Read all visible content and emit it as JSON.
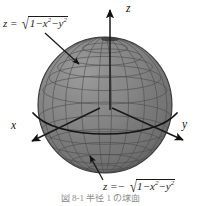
{
  "figure": {
    "type": "geometry-diagram",
    "background_color": "#ffffff",
    "sphere": {
      "fill_color": "#808080",
      "grid_color": "#4a4a4a",
      "outline_color": "#3a3a3a",
      "equator_color": "#1a1a1a",
      "center_x": 105,
      "center_y": 105,
      "radius_x": 67,
      "radius_y": 68,
      "meridian_count": 16,
      "parallel_count": 11
    },
    "axes": [
      {
        "name": "z-axis",
        "label": "z",
        "direction": "up",
        "tip_x": 110,
        "tip_y": 8,
        "tail_x": 110,
        "tail_y": 112
      },
      {
        "name": "x-axis",
        "label": "x",
        "direction": "down-left",
        "tip_x": 30,
        "tip_y": 143,
        "tail_x": 100,
        "tail_y": 108
      },
      {
        "name": "y-axis",
        "label": "y",
        "direction": "down-right",
        "tip_x": 185,
        "tip_y": 142,
        "tail_x": 112,
        "tail_y": 108
      }
    ],
    "labels": {
      "upper_hemisphere": {
        "lhs": "z",
        "equals": "=",
        "sign": "",
        "radical_glyph": "√",
        "radicand_parts": [
          "1",
          "−",
          "x",
          "2",
          "−",
          "y",
          "2"
        ],
        "plain_text": "z = √(1 − x² − y²)"
      },
      "lower_hemisphere": {
        "lhs": "z",
        "equals": "=",
        "sign": "−",
        "radical_glyph": "√",
        "radicand_parts": [
          "1",
          "−",
          "x",
          "2",
          "−",
          "y",
          "2"
        ],
        "plain_text": "z = −√(1 − x² − y²)"
      }
    },
    "leader_lines": [
      {
        "name": "upper-hemisphere-leader",
        "from_x": 46,
        "from_y": 36,
        "to_x": 80,
        "to_y": 66
      },
      {
        "name": "lower-hemisphere-leader",
        "from_x": 101,
        "from_y": 183,
        "to_x": 89,
        "to_y": 155
      }
    ],
    "caption": "図 8-1  半径 1 の球面"
  }
}
